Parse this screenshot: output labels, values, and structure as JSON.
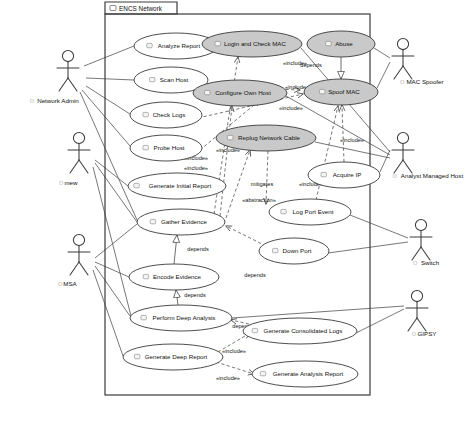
{
  "diagram": {
    "type": "uml-use-case-diagram",
    "package": {
      "name": "ENCS Network",
      "icon": "package-icon"
    },
    "canvas": {
      "width": 476,
      "height": 423
    },
    "frame": {
      "x": 105,
      "y": 14,
      "w": 265,
      "h": 381,
      "tab_w": 72,
      "tab_h": 12
    }
  },
  "use_cases": [
    {
      "id": "analyze-report",
      "label": "Analyze Report",
      "cx": 176,
      "cy": 46,
      "rx": 42,
      "ry": 13,
      "shaded": false
    },
    {
      "id": "scan-host",
      "label": "Scan Host",
      "cx": 171,
      "cy": 80,
      "rx": 37,
      "ry": 13,
      "shaded": false
    },
    {
      "id": "check-logs",
      "label": "Check Logs",
      "cx": 166,
      "cy": 115,
      "rx": 36,
      "ry": 13,
      "shaded": false
    },
    {
      "id": "probe-host",
      "label": "Probe Host",
      "cx": 166,
      "cy": 148,
      "rx": 36,
      "ry": 13,
      "shaded": false
    },
    {
      "id": "generate-initial-report",
      "label": "Generate Initial Report",
      "cx": 177,
      "cy": 186,
      "rx": 49,
      "ry": 13,
      "shaded": false
    },
    {
      "id": "gather-evidence",
      "label": "Gather Evidence",
      "cx": 181,
      "cy": 222,
      "rx": 44,
      "ry": 13,
      "shaded": false
    },
    {
      "id": "encode-evidence",
      "label": "Encode Evidence",
      "cx": 174,
      "cy": 277,
      "rx": 45,
      "ry": 13,
      "shaded": false
    },
    {
      "id": "perform-deep-analysis",
      "label": "Perform Deep Analysis",
      "cx": 181,
      "cy": 318,
      "rx": 51,
      "ry": 13,
      "shaded": false
    },
    {
      "id": "generate-deep-report",
      "label": "Generate Deep Report",
      "cx": 173,
      "cy": 357,
      "rx": 50,
      "ry": 13,
      "shaded": false
    },
    {
      "id": "login-check-mac",
      "label": "Login and Check MAC",
      "cx": 252,
      "cy": 44,
      "rx": 50,
      "ry": 13,
      "shaded": true
    },
    {
      "id": "configure-own-host",
      "label": "Configure Own Host",
      "cx": 240,
      "cy": 93,
      "rx": 47,
      "ry": 13,
      "shaded": true
    },
    {
      "id": "replug-network-cable",
      "label": "Replug Network Cable",
      "cx": 266,
      "cy": 138,
      "rx": 50,
      "ry": 13,
      "shaded": true
    },
    {
      "id": "abuse",
      "label": "Abuse",
      "cx": 341,
      "cy": 44,
      "rx": 34,
      "ry": 13,
      "shaded": true
    },
    {
      "id": "spoof-mac",
      "label": "Spoof MAC",
      "cx": 341,
      "cy": 92,
      "rx": 37,
      "ry": 13,
      "shaded": true
    },
    {
      "id": "acquire-ip",
      "label": "Acquire IP",
      "cx": 344,
      "cy": 175,
      "rx": 36,
      "ry": 13,
      "shaded": false
    },
    {
      "id": "log-port-event",
      "label": "Log Port Event",
      "cx": 310,
      "cy": 212,
      "rx": 41,
      "ry": 13,
      "shaded": false
    },
    {
      "id": "down-port",
      "label": "Down Port",
      "cx": 294,
      "cy": 251,
      "rx": 35,
      "ry": 13,
      "shaded": false
    },
    {
      "id": "generate-consolidated-logs",
      "label": "Generate Consolidated Logs",
      "cx": 300,
      "cy": 331,
      "rx": 57,
      "ry": 13,
      "shaded": false
    },
    {
      "id": "generate-analysis-report",
      "label": "Generate Analysis Report",
      "cx": 305,
      "cy": 374,
      "rx": 53,
      "ry": 13,
      "shaded": false
    }
  ],
  "actors": [
    {
      "id": "network-admin",
      "label": "Network Admin",
      "x": 68,
      "y": 56,
      "label_x": 58,
      "label_y": 103
    },
    {
      "id": "mew",
      "label": "mew",
      "x": 79,
      "y": 138,
      "label_x": 71,
      "label_y": 185
    },
    {
      "id": "msa",
      "label": "MSA",
      "x": 79,
      "y": 240,
      "label_x": 70,
      "label_y": 286
    },
    {
      "id": "mac-spoofer",
      "label": "MAC Spoofer",
      "x": 403,
      "y": 44,
      "label_x": 425,
      "label_y": 84
    },
    {
      "id": "analyst-managed-host",
      "label": "Analyst Managed Host",
      "x": 403,
      "y": 138,
      "label_x": 432,
      "label_y": 178
    },
    {
      "id": "switch",
      "label": "Switch",
      "x": 421,
      "y": 225,
      "label_x": 430,
      "label_y": 265
    },
    {
      "id": "gipsy",
      "label": "GIPSY",
      "x": 417,
      "y": 296,
      "label_x": 427,
      "label_y": 336
    }
  ],
  "edge_labels": [
    {
      "id": "inc-1",
      "text": "«include»",
      "x": 295,
      "y": 65
    },
    {
      "id": "inc-2",
      "text": "«include»",
      "x": 297,
      "y": 89
    },
    {
      "id": "inc-3",
      "text": "«include»",
      "x": 291,
      "y": 110
    },
    {
      "id": "inc-4",
      "text": "«include»",
      "x": 228,
      "y": 152
    },
    {
      "id": "inc-5",
      "text": "«include»",
      "x": 196,
      "y": 160
    },
    {
      "id": "inc-6",
      "text": "«include»",
      "x": 196,
      "y": 170
    },
    {
      "id": "inc-7",
      "text": "«include»",
      "x": 352,
      "y": 142
    },
    {
      "id": "inc-8",
      "text": "«include»",
      "x": 311,
      "y": 186
    },
    {
      "id": "inc-9",
      "text": "«include»",
      "x": 234,
      "y": 353
    },
    {
      "id": "inc-10",
      "text": "«include»",
      "x": 228,
      "y": 380
    },
    {
      "id": "dep-1",
      "text": "depends",
      "x": 311,
      "y": 67
    },
    {
      "id": "dep-2",
      "text": "depends",
      "x": 198,
      "y": 251
    },
    {
      "id": "dep-3",
      "text": "depends",
      "x": 255,
      "y": 277
    },
    {
      "id": "dep-4",
      "text": "depends",
      "x": 195,
      "y": 297
    },
    {
      "id": "dep-5",
      "text": "depends",
      "x": 243,
      "y": 328
    },
    {
      "id": "mit-1",
      "text": "mitigates",
      "x": 262,
      "y": 186
    },
    {
      "id": "abs-1",
      "text": "«abstraction»",
      "x": 259,
      "y": 202
    }
  ],
  "connectors": {
    "associations": [
      {
        "id": "na-analyze",
        "pts": "84,66 134,46"
      },
      {
        "id": "na-scan",
        "pts": "86,78 134,80"
      },
      {
        "id": "na-check",
        "pts": "86,86 130,114"
      },
      {
        "id": "na-probe",
        "pts": "82,90 130,146"
      },
      {
        "id": "na-gather",
        "pts": "80,92 137,220"
      },
      {
        "id": "mew-initial",
        "pts": "95,160 128,186"
      },
      {
        "id": "mew-gather",
        "pts": "95,163 137,222"
      },
      {
        "id": "mew-deep",
        "pts": "93,167 131,316"
      },
      {
        "id": "msa-gather",
        "pts": "95,258 137,224"
      },
      {
        "id": "msa-encode",
        "pts": "95,262 129,277"
      },
      {
        "id": "msa-perform",
        "pts": "95,266 130,316"
      },
      {
        "id": "msa-deepreport",
        "pts": "93,270 123,356"
      },
      {
        "id": "ms-abuse",
        "pts": "390,58 374,48"
      },
      {
        "id": "ms-spoof",
        "pts": "390,62 377,88"
      },
      {
        "id": "amh-login",
        "pts": "390,152 301,48"
      },
      {
        "id": "amh-config",
        "pts": "390,155 286,96"
      },
      {
        "id": "amh-replug",
        "pts": "390,158 315,142"
      },
      {
        "id": "amh-acquire",
        "pts": "390,150 380,172"
      },
      {
        "id": "sw-logport",
        "pts": "408,238 350,215"
      },
      {
        "id": "sw-downport",
        "pts": "408,242 328,253"
      },
      {
        "id": "gipsy-conso",
        "pts": "404,309 356,333"
      },
      {
        "id": "gipsy-perform",
        "pts": "404,306 232,318"
      }
    ],
    "dependencies": [
      {
        "id": "d-scan-spoof",
        "pts": "196,86 300,90"
      },
      {
        "id": "d-check-spoof",
        "pts": "198,118 303,94"
      },
      {
        "id": "d-probe-config",
        "pts": "200,150 260,100"
      },
      {
        "id": "d-gather-login",
        "pts": "214,214 238,57"
      },
      {
        "id": "d-gather-config",
        "pts": "220,216 232,106"
      },
      {
        "id": "d-gather-replug",
        "pts": "226,218 250,150"
      },
      {
        "id": "d-replug-logport",
        "pts": "268,151 266,204"
      },
      {
        "id": "d-acquire-spoof",
        "pts": "344,162 342,105"
      },
      {
        "id": "d-logport-spoof",
        "pts": "316,200 338,106"
      },
      {
        "id": "d-downport-gather",
        "pts": "266,246 226,226"
      },
      {
        "id": "d-conso-perform",
        "pts": "249,324 231,320"
      },
      {
        "id": "d-deepreport-conso",
        "pts": "218,352 250,333"
      },
      {
        "id": "d-deepreport-ana",
        "pts": "216,362 254,374"
      }
    ],
    "generalizations": [
      {
        "id": "g-abuse-spoof",
        "pts": "341,57 341,79"
      },
      {
        "id": "g-encode-gather",
        "pts": "174,264 177,235"
      },
      {
        "id": "g-perform-encode",
        "pts": "178,305 176,290"
      }
    ]
  }
}
